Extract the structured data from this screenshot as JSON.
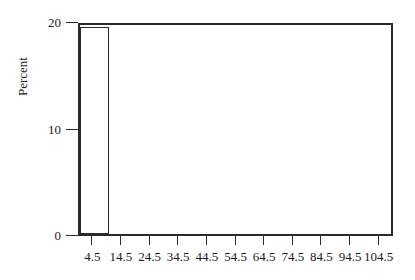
{
  "chart_data": {
    "type": "bar",
    "title": "",
    "subtitle": "",
    "xlabel": "",
    "ylabel": "Percent",
    "xlim": [
      -0.5,
      109.5
    ],
    "ylim": [
      0,
      20
    ],
    "grid": false,
    "legend": null,
    "x_tick_labels": [
      "4.5",
      "14.5",
      "24.5",
      "34.5",
      "44.5",
      "54.5",
      "64.5",
      "74.5",
      "84.5",
      "94.5",
      "104.5"
    ],
    "x_tick_values": [
      4.5,
      14.5,
      24.5,
      34.5,
      44.5,
      54.5,
      64.5,
      74.5,
      84.5,
      94.5,
      104.5
    ],
    "y_tick_labels": [
      "0",
      "10",
      "20"
    ],
    "y_tick_values": [
      0,
      10,
      20
    ],
    "bin_width": 10,
    "categories": [
      "4.5",
      "14.5",
      "24.5",
      "34.5",
      "44.5",
      "54.5",
      "64.5",
      "74.5",
      "84.5",
      "94.5",
      "104.5"
    ],
    "values": [
      19.4,
      0,
      0,
      0,
      0,
      0,
      0,
      0,
      0,
      0,
      0
    ],
    "bars": [
      {
        "label": "4.5",
        "center": 4.5,
        "left": -0.5,
        "right": 9.5,
        "value": 19.4
      }
    ]
  },
  "axes": {
    "y_title": "Percent",
    "y_ticks": [
      {
        "label": "20",
        "value": 20
      },
      {
        "label": "10",
        "value": 10
      },
      {
        "label": "0",
        "value": 0
      }
    ],
    "x_ticks": [
      {
        "label": "4.5",
        "value": 4.5
      },
      {
        "label": "14.5",
        "value": 14.5
      },
      {
        "label": "24.5",
        "value": 24.5
      },
      {
        "label": "34.5",
        "value": 34.5
      },
      {
        "label": "44.5",
        "value": 44.5
      },
      {
        "label": "54.5",
        "value": 54.5
      },
      {
        "label": "64.5",
        "value": 64.5
      },
      {
        "label": "74.5",
        "value": 74.5
      },
      {
        "label": "84.5",
        "value": 84.5
      },
      {
        "label": "94.5",
        "value": 94.5
      },
      {
        "label": "104.5",
        "value": 104.5
      }
    ]
  },
  "style": {
    "axis_color": "#2b2b2b",
    "bar_fill": "#ffffff",
    "bar_edge": "#2b2b2b",
    "background": "#ffffff",
    "text_color": "#1a1a1a"
  }
}
